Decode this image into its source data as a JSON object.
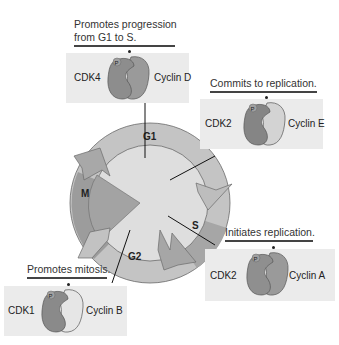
{
  "diagram": {
    "type": "cell-cycle",
    "phases": [
      {
        "id": "g1",
        "label": "G1"
      },
      {
        "id": "s",
        "label": "S"
      },
      {
        "id": "g2",
        "label": "G2"
      },
      {
        "id": "m",
        "label": "M"
      }
    ],
    "complexes": [
      {
        "id": "cdk4-cyclin-d",
        "caption_line1": "Promotes progression",
        "caption_line2": "from G1 to S.",
        "cdk": "CDK4",
        "cyclin": "Cyclin D",
        "phospho": "P"
      },
      {
        "id": "cdk2-cyclin-e",
        "caption_line1": "Commits to replication.",
        "cdk": "CDK2",
        "cyclin": "Cyclin E",
        "phospho": "P"
      },
      {
        "id": "cdk2-cyclin-a",
        "caption_line1": "Initiates replication.",
        "cdk": "CDK2",
        "cyclin": "Cyclin A",
        "phospho": "P"
      },
      {
        "id": "cdk1-cyclin-b",
        "caption_line1": "Promotes mitosis.",
        "cdk": "CDK1",
        "cyclin": "Cyclin B",
        "phospho": "P"
      }
    ],
    "colors": {
      "box_bg": "#ebebeb",
      "ring_g1": "#c6c6c6",
      "ring_s": "#a9a9a9",
      "ring_g2": "#bcbcbc",
      "ring_m": "#9d9d9d",
      "center": "#dcdcdc",
      "cdk": "#8f8f8f",
      "cyclin_dark": "#9a9a9a",
      "cyclin_light": "#d2d2d2"
    }
  }
}
